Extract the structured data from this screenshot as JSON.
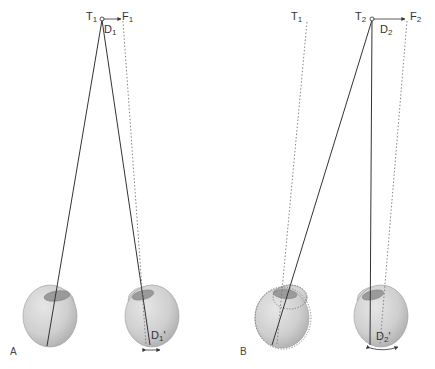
{
  "figure": {
    "panels": [
      {
        "id": "A",
        "label": "A",
        "points": {
          "target": {
            "letter": "T",
            "sub": "1"
          },
          "fixation": {
            "letter": "F",
            "sub": "1"
          },
          "disparity": {
            "letter": "D",
            "sub": "1"
          },
          "retinal_disparity": {
            "letter": "D",
            "sub": "1",
            "prime": "'"
          }
        }
      },
      {
        "id": "B",
        "label": "B",
        "points": {
          "prev_target": {
            "letter": "T",
            "sub": "1"
          },
          "target": {
            "letter": "T",
            "sub": "2"
          },
          "fixation": {
            "letter": "F",
            "sub": "2"
          },
          "disparity": {
            "letter": "D",
            "sub": "2"
          },
          "retinal_disparity": {
            "letter": "D",
            "sub": "2",
            "prime": "'"
          }
        }
      }
    ],
    "colors": {
      "eye_fill": "#c9c9c9",
      "eye_stroke": "#9a9a9a",
      "line": "#333333",
      "dotted": "#777777",
      "background": "#ffffff"
    }
  }
}
